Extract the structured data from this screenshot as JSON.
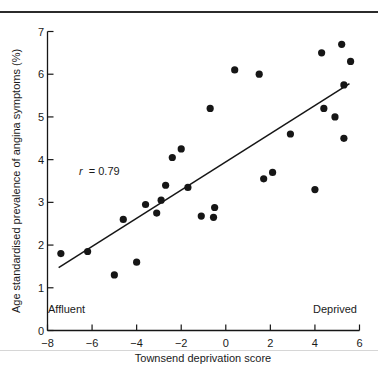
{
  "page": {
    "background": "#ffffff",
    "top_rule_color": "#2b2b2b",
    "faint_rule_color": "#d6d6d6"
  },
  "chart_data": {
    "type": "scatter",
    "title": "",
    "xlabel": "Townsend deprivation score",
    "ylabel": "Age standardised prevalence of angina symptoms (%)",
    "xlim": [
      -8,
      6
    ],
    "ylim": [
      0,
      7
    ],
    "xticks": [
      -8,
      -6,
      -4,
      -2,
      0,
      2,
      4,
      6
    ],
    "yticks": [
      0,
      1,
      2,
      3,
      4,
      5,
      6,
      7
    ],
    "grid": false,
    "legend": "none",
    "point_color": "#161616",
    "line_color": "#161616",
    "axis_color": "#161616",
    "correlation_label": {
      "text": "r = 0.79",
      "variable": "r",
      "rest": "= 0.79",
      "x": -5.85,
      "y": 3.6
    },
    "axis_end_labels": {
      "left": "Affluent",
      "right": "Deprived",
      "y": 0.45
    },
    "regression_line": {
      "x1": -7.5,
      "y1": 1.47,
      "x2": 5.55,
      "y2": 5.78
    },
    "points": [
      [
        -7.4,
        1.8
      ],
      [
        -6.2,
        1.85
      ],
      [
        -5.0,
        1.3
      ],
      [
        -4.6,
        2.6
      ],
      [
        -4.0,
        1.6
      ],
      [
        -3.6,
        2.95
      ],
      [
        -3.1,
        2.75
      ],
      [
        -2.9,
        3.05
      ],
      [
        -2.7,
        3.4
      ],
      [
        -2.4,
        4.05
      ],
      [
        -2.0,
        4.25
      ],
      [
        -1.7,
        3.35
      ],
      [
        -1.1,
        2.68
      ],
      [
        -0.7,
        5.2
      ],
      [
        -0.55,
        2.65
      ],
      [
        -0.5,
        2.88
      ],
      [
        0.4,
        6.1
      ],
      [
        1.5,
        6.0
      ],
      [
        1.7,
        3.55
      ],
      [
        2.1,
        3.7
      ],
      [
        2.9,
        4.6
      ],
      [
        4.0,
        3.3
      ],
      [
        4.3,
        6.5
      ],
      [
        4.4,
        5.2
      ],
      [
        4.9,
        5.0
      ],
      [
        5.2,
        6.7
      ],
      [
        5.3,
        5.75
      ],
      [
        5.3,
        4.5
      ],
      [
        5.6,
        6.3
      ]
    ]
  }
}
